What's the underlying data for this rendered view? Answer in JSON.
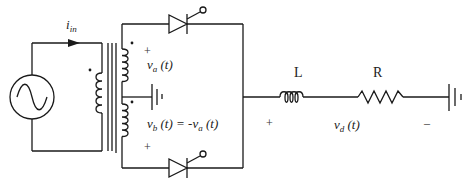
{
  "diagram": {
    "type": "circuit-schematic",
    "title": "",
    "labels": {
      "input_current": "i",
      "input_current_sub": "in",
      "va_main": "v",
      "va_sub": "a",
      "va_arg": " (t)",
      "vb_main": "v",
      "vb_sub": "b",
      "vb_arg": " (t) = -v",
      "vb_rhs_sub": "a",
      "vb_rhs_arg": " (t)",
      "inductor": "L",
      "resistor": "R",
      "vd_main": "v",
      "vd_sub": "d",
      "vd_arg": " (t)",
      "plus": "+",
      "minus": "–"
    },
    "components": [
      {
        "id": "ac-source",
        "kind": "AC voltage source"
      },
      {
        "id": "transformer",
        "kind": "center-tapped transformer",
        "primary_dot": true,
        "secondary_dots": 2
      },
      {
        "id": "thyristor-top",
        "kind": "thyristor (SCR)"
      },
      {
        "id": "thyristor-bottom",
        "kind": "thyristor (SCR)"
      },
      {
        "id": "inductor",
        "kind": "inductor",
        "label": "L"
      },
      {
        "id": "resistor",
        "kind": "resistor",
        "label": "R"
      },
      {
        "id": "dc-source-center-tap",
        "kind": "DC source / ground symbol"
      },
      {
        "id": "dc-source-load",
        "kind": "DC source / ground symbol"
      }
    ],
    "colors": {
      "line": "#1a1a1a",
      "text": "#222222",
      "background": "#ffffff"
    }
  }
}
